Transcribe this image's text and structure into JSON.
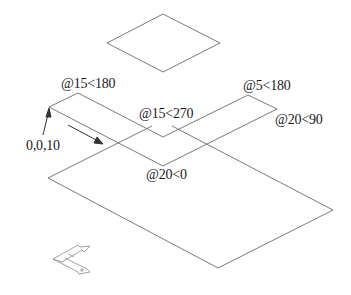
{
  "diagram": {
    "type": "isometric-cad-drawing",
    "stroke_color": "#7a7a7a",
    "text_color": "#1a1a1a",
    "labels": {
      "start_point": "0,0,10",
      "seg1": "@15<180",
      "seg2": "@15<270",
      "seg3": "@5<180",
      "seg4": "@20<90",
      "seg5": "@20<0"
    },
    "shapes": {
      "top_rhombus": [
        [
          163,
          14
        ],
        [
          220,
          43
        ],
        [
          163,
          72
        ],
        [
          107,
          43
        ]
      ],
      "l_shape": [
        [
          49,
          107
        ],
        [
          78,
          93
        ],
        [
          163,
          137
        ],
        [
          248,
          95
        ],
        [
          277,
          109
        ],
        [
          163,
          166
        ]
      ],
      "base_parallelogram_visible_edges": [
        [
          [
            48,
            178
          ],
          [
            152,
            126
          ]
        ],
        [
          [
            172,
            126
          ],
          [
            333,
            210
          ]
        ],
        [
          [
            333,
            210
          ],
          [
            218,
            268
          ]
        ],
        [
          [
            218,
            268
          ],
          [
            48,
            178
          ]
        ]
      ]
    },
    "ucs_icon": "ucs-isometric-icon"
  }
}
